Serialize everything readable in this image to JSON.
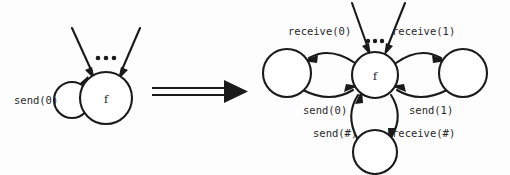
{
  "figure": {
    "background_color": "#fdfdfd",
    "stroke_color": "#1a1a1a"
  },
  "left_diagram": {
    "name": "before-transformation",
    "center_node": {
      "label": "f",
      "cx": 106,
      "cy": 98,
      "r": 26
    },
    "self_loop_node": {
      "label": "",
      "cx": 72,
      "cy": 100,
      "r": 18
    },
    "self_loop_label": "send(0)",
    "incoming_edges_label": "...",
    "incoming_arrow_count": 2
  },
  "implication_arrow": {
    "name": "implies-arrow",
    "symbol": "=>",
    "x_start": 152,
    "x_end": 246,
    "y": 92
  },
  "right_diagram": {
    "name": "after-transformation",
    "center_node": {
      "label": "f",
      "cx": 375,
      "cy": 75,
      "r": 23
    },
    "left_node": {
      "label": "",
      "cx": 287,
      "cy": 73,
      "r": 24
    },
    "right_node": {
      "label": "",
      "cx": 463,
      "cy": 73,
      "r": 24
    },
    "bottom_node": {
      "label": "",
      "cx": 375,
      "cy": 152,
      "r": 22
    },
    "incoming_edges_label": "...",
    "incoming_arrow_count": 2,
    "edge_labels": {
      "receive_0": "receive(0)",
      "receive_1": "receive(1)",
      "send_0": "send(0)",
      "send_1": "send(1)",
      "send_hash": "send(#)",
      "receive_hash": "receive(#)"
    }
  },
  "label_positions": {
    "send_0_left": {
      "x": 14,
      "y": 104
    },
    "receive_0": {
      "x": 288,
      "y": 35
    },
    "receive_1": {
      "x": 392,
      "y": 35
    },
    "send_0_right": {
      "x": 303,
      "y": 114
    },
    "send_1_right": {
      "x": 409,
      "y": 114
    },
    "send_hash": "317,133",
    "receive_hash": "391,133"
  }
}
